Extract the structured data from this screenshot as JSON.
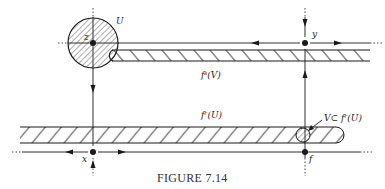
{
  "figure": {
    "caption": "FIGURE 7.14",
    "labels": {
      "U": "U",
      "z": "z",
      "y": "y",
      "x": "x",
      "f": "f",
      "fs_V": "fˢ(V)",
      "fr_U": "fʳ(U)",
      "V_subset": "V⊂ fʳ(U)"
    },
    "points": [
      {
        "name": "z",
        "x": 93,
        "y": 43
      },
      {
        "name": "y",
        "x": 305,
        "y": 43
      },
      {
        "name": "x",
        "x": 93,
        "y": 152
      },
      {
        "name": "f",
        "x": 305,
        "y": 152
      }
    ],
    "regions": [
      {
        "name": "U",
        "shape": "disk",
        "hatched": true
      },
      {
        "name": "f^s(V)",
        "shape": "band",
        "hatched": true
      },
      {
        "name": "f^r(U)",
        "shape": "band",
        "hatched": true
      },
      {
        "name": "V",
        "shape": "small disk",
        "hatched": true
      }
    ],
    "colors": {
      "ink": "#1a1a1a",
      "background": "#ffffff"
    }
  }
}
